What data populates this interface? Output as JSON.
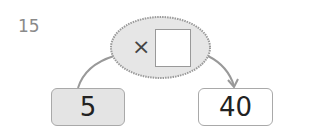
{
  "problem": {
    "number": "15",
    "operator_symbol": "×",
    "input_value": "5",
    "output_value": "40",
    "blank_value": ""
  },
  "colors": {
    "number_text": "#8a8a8a",
    "ellipse_fill": "#e6e6e6",
    "ellipse_border": "#9a9a9a",
    "input_box_fill": "#e4e4e4",
    "output_box_fill": "#ffffff",
    "arrow": "#8f8f8f"
  }
}
